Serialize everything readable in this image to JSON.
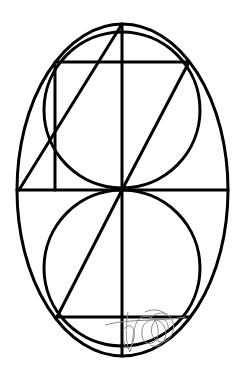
{
  "diagram": {
    "stroke_color": "#000000",
    "background": "#ffffff",
    "scribble_color": "#8c8c8c",
    "ellipse": {
      "cx": 122.5,
      "cy": 190,
      "rx": 105.5,
      "ry": 166
    },
    "circles": [
      {
        "name": "upper-circle",
        "cx": 122,
        "cy": 110,
        "r": 78
      },
      {
        "name": "lower-circle",
        "cx": 122,
        "cy": 268,
        "r": 78
      }
    ],
    "lines": [
      {
        "name": "vertical-axis",
        "x1": 122,
        "y1": 24,
        "x2": 122,
        "y2": 356
      },
      {
        "name": "middle-horizontal",
        "x1": 17,
        "y1": 190,
        "x2": 228,
        "y2": 190
      },
      {
        "name": "top-horizontal",
        "x1": 57,
        "y1": 62,
        "x2": 189,
        "y2": 62
      },
      {
        "name": "bottom-horizontal",
        "x1": 57,
        "y1": 317,
        "x2": 190,
        "y2": 317
      },
      {
        "name": "square-left-vertical",
        "x1": 55,
        "y1": 62,
        "x2": 55,
        "y2": 190
      },
      {
        "name": "upper-left-diagonal",
        "x1": 122,
        "y1": 24,
        "x2": 19,
        "y2": 190
      },
      {
        "name": "upper-right-diagonal",
        "x1": 189,
        "y1": 62,
        "x2": 122,
        "y2": 190
      },
      {
        "name": "lower-left-diagonal",
        "x1": 122,
        "y1": 190,
        "x2": 57,
        "y2": 317
      }
    ]
  }
}
